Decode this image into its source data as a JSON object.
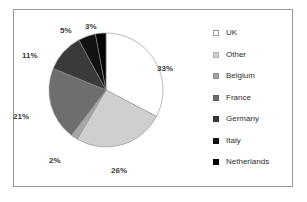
{
  "figure": {
    "border_color": "#9a9a9a",
    "background": "#ffffff"
  },
  "chart_data": {
    "type": "pie",
    "title": "",
    "subtitle": "",
    "xlabel": "",
    "ylabel": "",
    "legend_position": "right",
    "grid": false,
    "start_angle_deg": 0,
    "direction": "clockwise",
    "categories": [
      "UK",
      "Other",
      "Belgium",
      "France",
      "Germany",
      "Italy",
      "Netherlands"
    ],
    "values": [
      33,
      26,
      2,
      21,
      11,
      5,
      3
    ],
    "value_unit": "%",
    "data_labels": [
      "33%",
      "26%",
      "2%",
      "21%",
      "11%",
      "5%",
      "3%"
    ],
    "colors": [
      "#ffffff",
      "#cfcfcf",
      "#a6a6a6",
      "#6e6e6e",
      "#3a3a3a",
      "#121212",
      "#000000"
    ],
    "slice_edge_color": "#8f8f8f",
    "slices": [
      {
        "label": "UK",
        "value": 33,
        "data_label": "33%",
        "color": "#ffffff"
      },
      {
        "label": "Other",
        "value": 26,
        "data_label": "26%",
        "color": "#cfcfcf"
      },
      {
        "label": "Belgium",
        "value": 2,
        "data_label": "2%",
        "color": "#a6a6a6"
      },
      {
        "label": "France",
        "value": 21,
        "data_label": "21%",
        "color": "#6e6e6e"
      },
      {
        "label": "Germany",
        "value": 11,
        "data_label": "11%",
        "color": "#3a3a3a"
      },
      {
        "label": "Italy",
        "value": 5,
        "data_label": "5%",
        "color": "#121212"
      },
      {
        "label": "Netherlands",
        "value": 3,
        "data_label": "3%",
        "color": "#000000"
      }
    ]
  },
  "labels": {
    "uk": "33%",
    "other": "26%",
    "belgium": "2%",
    "france": "21%",
    "germany": "11%",
    "italy": "5%",
    "netherlands": "3%"
  },
  "legend": {
    "items": [
      {
        "label": "UK",
        "color": "#ffffff",
        "border": "#9a9a9a"
      },
      {
        "label": "Other",
        "color": "#cfcfcf",
        "border": "#b3b3b3"
      },
      {
        "label": "Belgium",
        "color": "#a6a6a6",
        "border": "#8f8f8f"
      },
      {
        "label": "France",
        "color": "#6e6e6e",
        "border": "#5c5c5c"
      },
      {
        "label": "Germany",
        "color": "#3a3a3a",
        "border": "#2e2e2e"
      },
      {
        "label": "Italy",
        "color": "#121212",
        "border": "#0d0d0d"
      },
      {
        "label": "Netherlands",
        "color": "#000000",
        "border": "#000000"
      }
    ]
  }
}
